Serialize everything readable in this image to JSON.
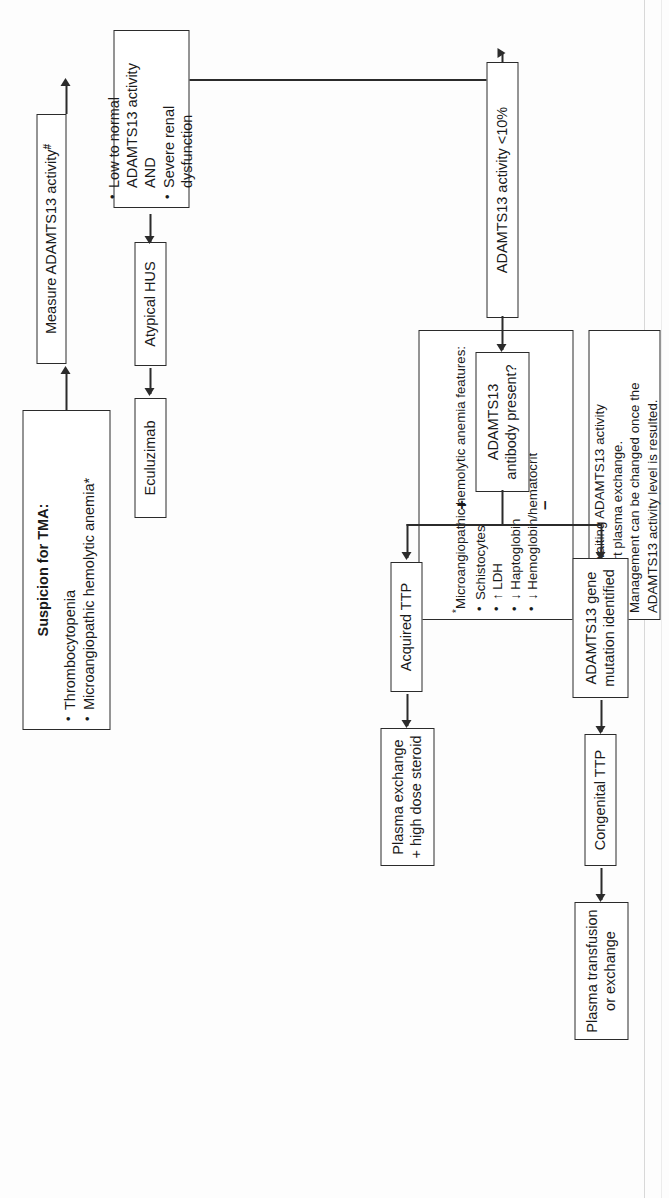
{
  "diagram": {
    "nodes": {
      "suspicion": {
        "heading": "Suspicion for TMA:",
        "bullets": [
          "Thrombocytopenia",
          "Microangiopathic hemolytic anemia*"
        ]
      },
      "measure": {
        "label": "Measure ADAMTS13 activity",
        "marker": "#"
      },
      "low_normal": {
        "bullets": [
          "Low to normal ADAMTS13 activity AND",
          "Severe renal dysfunction"
        ]
      },
      "ahus": {
        "label": "Atypical HUS"
      },
      "eculizumab": {
        "label": "Eculuzimab"
      },
      "activity_low": {
        "label": "ADAMTS13 activity <10%"
      },
      "antibody": {
        "label": "ADAMTS13 antibody present?"
      },
      "acquired_ttp": {
        "label": "Acquired TTP"
      },
      "plasma_exchange": {
        "label": "Plasma exchange + high dose steroid"
      },
      "gene_mutation": {
        "label": "ADAMTS13 gene mutation identified"
      },
      "congenital_ttp": {
        "label": "Congenital TTP"
      },
      "plasma_transfusion": {
        "label": "Plasma transfusion or exchange"
      }
    },
    "edge_labels": {
      "positive": "+",
      "negative": "–"
    },
    "footnotes": {
      "star": {
        "marker": "*",
        "heading": "Microangiopathic hemolytic anemia features:",
        "items": [
          {
            "arrow": "",
            "text": "Schistocytes"
          },
          {
            "arrow": "↑",
            "text": "LDH"
          },
          {
            "arrow": "↓",
            "text": "Haptoglobin"
          },
          {
            "arrow": "↓",
            "text": "Hemoglobin/hematocrit"
          }
        ]
      },
      "hash": {
        "marker": "#",
        "lines": [
          "While awaiting ADAMTS13 activity",
          "level, start plasma exchange.",
          "Management can be changed once the",
          "ADAMTS13 activity level is resulted."
        ]
      }
    }
  }
}
